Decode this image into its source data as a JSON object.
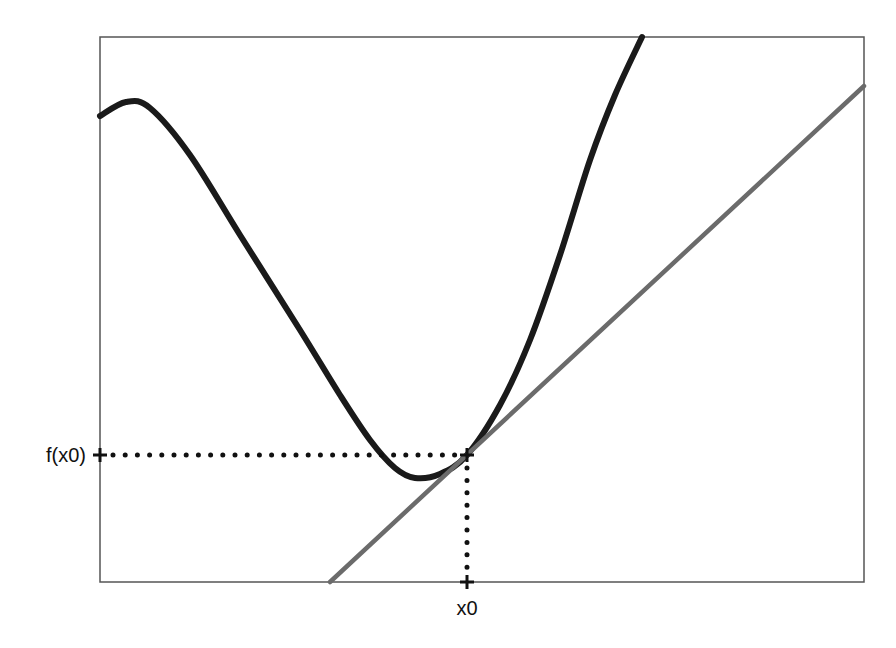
{
  "diagram": {
    "type": "tangent-line-illustration",
    "labels": {
      "y_marker": "f(x0)",
      "x_marker": "x0"
    },
    "colors": {
      "background": "#ffffff",
      "frame": "#555555",
      "curve": "#1a1a1a",
      "tangent": "#6b6b6b",
      "guides": "#111111"
    },
    "frame": {
      "left": 100,
      "top": 37,
      "right": 864,
      "bottom": 582
    },
    "point": {
      "x": 467,
      "y": 455
    },
    "curve_points": [
      [
        100,
        116
      ],
      [
        126,
        102
      ],
      [
        150,
        108
      ],
      [
        190,
        155
      ],
      [
        240,
        235
      ],
      [
        300,
        330
      ],
      [
        340,
        395
      ],
      [
        370,
        440
      ],
      [
        395,
        468
      ],
      [
        415,
        478
      ],
      [
        440,
        474
      ],
      [
        467,
        455
      ],
      [
        500,
        405
      ],
      [
        530,
        340
      ],
      [
        560,
        255
      ],
      [
        590,
        160
      ],
      [
        615,
        95
      ],
      [
        642,
        37
      ]
    ],
    "tangent_line": {
      "start": [
        330,
        582
      ],
      "end": [
        864,
        86
      ]
    }
  }
}
